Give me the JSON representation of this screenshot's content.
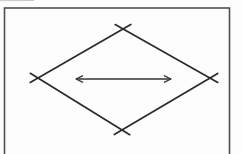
{
  "figure": {
    "width": 242,
    "height": 154
  },
  "colors": {
    "background": "#fdfdfd",
    "frame": "#4f4f4f",
    "line": "#2b2b2b",
    "arrow": "#333333",
    "artifact": "#c8c8c8"
  },
  "frame": {
    "x": 4.5,
    "y": 8,
    "width": 225,
    "height": 152,
    "stroke_width": 1.6
  },
  "diamond": {
    "vertices": {
      "top": [
        123,
        29
      ],
      "right": [
        210,
        78
      ],
      "bottom": [
        122,
        130
      ],
      "left": [
        38,
        78
      ]
    },
    "stroke_width": 1.7,
    "edges": [
      {
        "name": "diamond-edge-left-top",
        "x1": 30.2,
        "y1": 82.5,
        "x2": 130.8,
        "y2": 24.5
      },
      {
        "name": "diamond-edge-top-right",
        "x1": 115.2,
        "y1": 24.6,
        "x2": 217.8,
        "y2": 82.4
      },
      {
        "name": "diamond-edge-right-bottom",
        "x1": 217.7,
        "y1": 73.4,
        "x2": 114.3,
        "y2": 134.6
      },
      {
        "name": "diamond-edge-bottom-left",
        "x1": 129.7,
        "y1": 134.7,
        "x2": 30.3,
        "y2": 73.3
      }
    ]
  },
  "arrow": {
    "shaft": {
      "x1": 76,
      "y1": 79,
      "x2": 171,
      "y2": 79
    },
    "stroke_width": 1.3,
    "head_left_points": "82.5,75.8 76,79 82.5,82.2",
    "head_right_points": "164.5,75.8 171,79 164.5,82.2"
  },
  "artifact_line": {
    "x1": 0,
    "y1": 0.7,
    "x2": 34,
    "y2": 0.5,
    "stroke_width": 1
  }
}
